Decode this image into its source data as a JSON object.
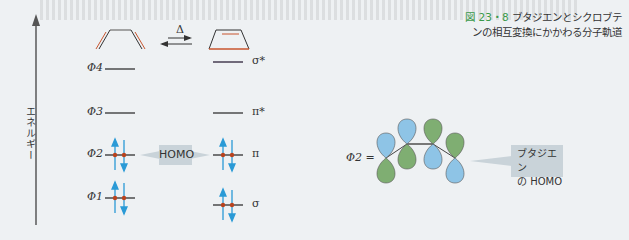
{
  "caption": {
    "figure_number": "図 23・8",
    "text": "ブタジエンとシクロブテンの相互変換にかかわる分子軌道"
  },
  "axis": {
    "label": "エネルギー"
  },
  "reaction": {
    "arrow_label": "Δ"
  },
  "butadiene_orbitals": [
    {
      "label": "Φ4",
      "electrons": 0
    },
    {
      "label": "Φ3",
      "electrons": 0
    },
    {
      "label": "Φ2",
      "electrons": 2
    },
    {
      "label": "Φ1",
      "electrons": 2
    }
  ],
  "cyclobutene_orbitals": [
    {
      "label": "σ*",
      "electrons": 0
    },
    {
      "label": "π*",
      "electrons": 0
    },
    {
      "label": "π",
      "electrons": 2
    },
    {
      "label": "σ",
      "electrons": 2
    }
  ],
  "homo_label": "HOMO",
  "orbital_picture": {
    "label": "Φ2 =",
    "callout_line1": "ブタジエン",
    "callout_line2": "の HOMO"
  },
  "colors": {
    "lobe_blue": "#8ec4e6",
    "lobe_green": "#7fae72",
    "electron_arrow": "#2a9ad6",
    "electron_dot": "#b8431f",
    "bond_red": "#c8552e",
    "caption_accent": "#3a9a4a",
    "callout_bg": "#c9d3d9"
  }
}
